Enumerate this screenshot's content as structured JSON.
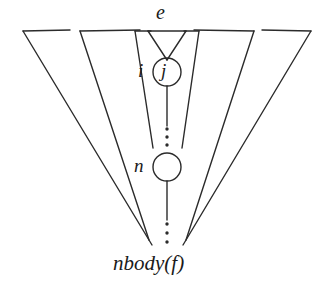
{
  "figure": {
    "stroke_color": "#2b2b2b",
    "background_color": "#ffffff",
    "labels": {
      "edge_top": "e",
      "node_left": "i",
      "node_inner": "j",
      "node_n": "n",
      "bottom": "nbody(f)"
    },
    "nodes": [
      {
        "id": "j-node",
        "label": "j",
        "side_label": "i",
        "cx": 167,
        "cy": 72,
        "r": 14
      },
      {
        "id": "n-node",
        "label": "n",
        "side_label": "n",
        "cx": 167,
        "cy": 167,
        "r": 14
      }
    ],
    "funnels": [
      {
        "name": "funnel-outer-1",
        "left_x": 23,
        "right_x": 311,
        "top_y": 31,
        "apex_x": 167,
        "apex_y": 245
      },
      {
        "name": "funnel-outer-2",
        "left_x": 80,
        "right_x": 254,
        "top_y": 31,
        "apex_x": 167,
        "apex_y": 240
      },
      {
        "name": "funnel-inner-1",
        "left_x": 135,
        "right_x": 199,
        "top_y": 31,
        "apex_x": 167,
        "apex_y": 148
      },
      {
        "name": "funnel-inner-2",
        "left_x": 148,
        "right_x": 186,
        "top_y": 31,
        "apex_x": 167,
        "apex_y": 58
      }
    ],
    "dotted_runs": [
      {
        "name": "dots-above-n",
        "x": 167,
        "y_start": 128,
        "y_end": 146
      },
      {
        "name": "dots-below-n",
        "x": 167,
        "y_start": 222,
        "y_end": 244
      }
    ],
    "solid_runs": [
      {
        "name": "line-j-down",
        "x": 167,
        "y_start": 86,
        "y_end": 126
      },
      {
        "name": "line-n-down",
        "x": 167,
        "y_start": 181,
        "y_end": 220
      }
    ]
  }
}
